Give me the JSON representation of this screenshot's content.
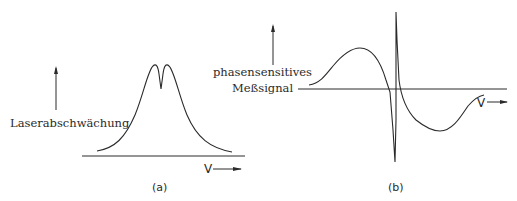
{
  "panel_a": {
    "ylabel": "Laserabschwächung",
    "xlabel": "V",
    "caption": "(a)",
    "description": "Doppler-broadened absorption profile with a narrow Lamb dip at the center"
  },
  "panel_b": {
    "ylabel_line1": "phasensensitives",
    "ylabel_line2": "Meßsignal",
    "xlabel": "V",
    "caption": "(b)",
    "description": "Phase-sensitive (derivative) signal with dispersion-shaped narrow feature at center"
  },
  "colors": {
    "line": "#2a2a2a",
    "background": "#ffffff"
  }
}
